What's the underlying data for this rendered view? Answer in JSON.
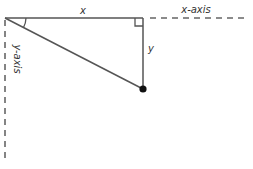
{
  "diagram": {
    "type": "right-triangle-on-axes",
    "labels": {
      "x_side": "x",
      "y_side": "y",
      "x_axis": "x-axis",
      "y_axis": "y-axis"
    },
    "points": {
      "origin": [
        5,
        18
      ],
      "right_angle_vertex": [
        143,
        18
      ],
      "point": [
        143,
        89
      ]
    },
    "axes": {
      "x_axis_dashed_end": 246,
      "y_axis_dashed_end": 162
    },
    "colors": {
      "line": "#555555",
      "dash": "#666666",
      "point": "#111111",
      "text": "#333333"
    },
    "markers": {
      "angle_arc_at_origin": true,
      "right_angle_box_at_vertex": true,
      "filled_dot_at_point": true
    }
  }
}
